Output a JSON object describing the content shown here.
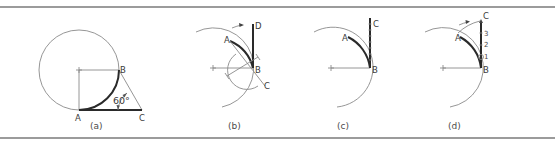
{
  "figure": {
    "panels": [
      {
        "caption": "(a)",
        "points": {
          "A": "A",
          "B": "B",
          "C": "C"
        },
        "angle_label": "60°"
      },
      {
        "caption": "(b)",
        "points": {
          "A": "A",
          "B": "B",
          "C": "C",
          "D": "D"
        }
      },
      {
        "caption": "(c)",
        "points": {
          "A": "A",
          "B": "B",
          "C": "C"
        }
      },
      {
        "caption": "(d)",
        "points": {
          "A": "A",
          "B": "B",
          "C": "C"
        },
        "divisions": [
          "3",
          "2",
          "1"
        ]
      }
    ]
  }
}
